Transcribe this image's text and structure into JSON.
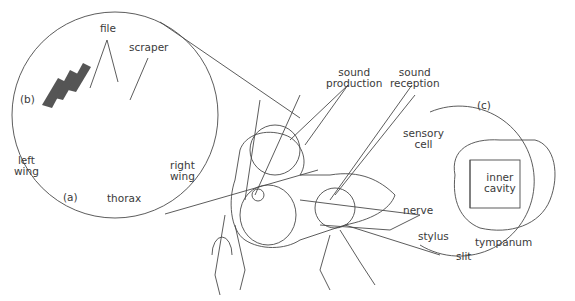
{
  "figure": {
    "panels": {
      "a": "(a)",
      "b": "(b)",
      "c": "(c)"
    },
    "labels": {
      "file": "file",
      "scraper": "scraper",
      "left_wing": [
        "left",
        "wing"
      ],
      "right_wing": [
        "right",
        "wing"
      ],
      "thorax": "thorax",
      "sound_production": [
        "sound",
        "production"
      ],
      "sound_reception": [
        "sound",
        "reception"
      ],
      "sensory_cell": [
        "sensory",
        "cell"
      ],
      "inner_cavity": [
        "inner",
        "cavity"
      ],
      "nerve": "nerve",
      "stylus": "stylus",
      "slit": "slit",
      "tympanum": "tympanum"
    }
  },
  "colors": {
    "line": "#4a4a4a",
    "text": "#3a3a3a",
    "background": "#ffffff"
  }
}
